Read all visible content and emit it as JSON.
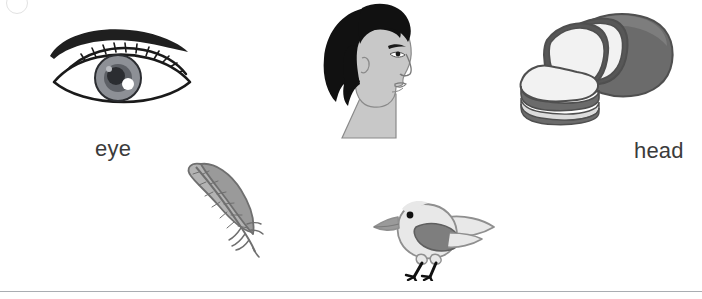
{
  "worksheet": {
    "title": "Picture vocabulary worksheet",
    "background_color": "#ffffff",
    "divider_color": "#a9adb2",
    "marker_color": "#e2e2e2",
    "label_color": "#3b3b3b"
  },
  "items": [
    {
      "id": "eye",
      "label": "eye",
      "icon": "eye-illustration",
      "colors": {
        "outline": "#1a1a1a",
        "brow": "#1f1f1f",
        "iris": "#8d9096",
        "iris_inner": "#5d6066",
        "pupil": "#2b2d31",
        "sclera": "#ffffff",
        "highlight": "#ffffff"
      }
    },
    {
      "id": "head",
      "label": "head",
      "icon": "head-profile-illustration",
      "colors": {
        "hair": "#111111",
        "skin": "#c8c8c8",
        "outline": "#8a8a8a",
        "neck": "#c8c8c8"
      }
    },
    {
      "id": "bread",
      "label": "bread",
      "icon": "bread-loaf-illustration",
      "colors": {
        "crust": "#6b6b6b",
        "crust_dark": "#575757",
        "slice": "#f2f2f2",
        "slice_shadow": "#dcdcdc",
        "outline": "#4f4f4f"
      }
    },
    {
      "id": "feather",
      "label": "feather",
      "icon": "feather-illustration",
      "colors": {
        "vane": "#b3b3b3",
        "vane_dark": "#9a9a9a",
        "shaft": "#6f6f6f",
        "outline": "#6f6f6f"
      }
    },
    {
      "id": "bird",
      "label": "bird",
      "icon": "bird-illustration",
      "colors": {
        "body": "#e8e8e8",
        "body_outline": "#8f8f8f",
        "wing": "#7e7e7e",
        "beak": "#9a9a9a",
        "eye": "#111111",
        "legs": "#111111"
      }
    }
  ]
}
